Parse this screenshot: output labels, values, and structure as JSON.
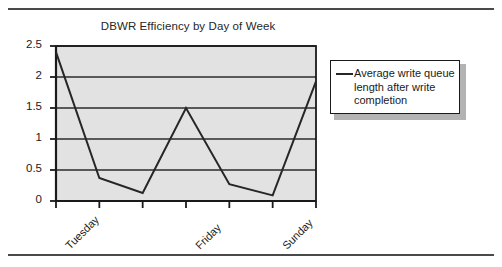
{
  "chart_data": {
    "type": "line",
    "title": "DBWR Efficiency by Day of Week",
    "xlabel": "",
    "ylabel": "",
    "ylim": [
      0,
      2.5
    ],
    "yticks": [
      "0",
      "0.5",
      "1",
      "1.5",
      "2",
      "2.5"
    ],
    "ytick_values": [
      0,
      0.5,
      1,
      1.5,
      2,
      2.5
    ],
    "grid": true,
    "grid_axis": "y",
    "legend_position": "right-outside",
    "plot_background": "#e2e2e2",
    "line_color": "#262626",
    "categories": [
      "Monday",
      "Tuesday",
      "Wednesday",
      "Thursday",
      "Friday",
      "Saturday",
      "Sunday"
    ],
    "xtick_labels": [
      "Tuesday",
      "Friday",
      "Sunday"
    ],
    "xtick_label_indices": [
      1,
      4,
      6
    ],
    "series": [
      {
        "name": "Average write queue length after write completion",
        "values": [
          2.4,
          0.37,
          0.13,
          1.5,
          0.27,
          0.09,
          1.93
        ]
      }
    ]
  },
  "legend": {
    "entries": [
      {
        "label": "Average write queue length after write completion",
        "swatch": "line-swatch"
      }
    ]
  },
  "figure": {
    "top_rule": "horizontal-rule",
    "bottom_rule": "horizontal-rule"
  }
}
